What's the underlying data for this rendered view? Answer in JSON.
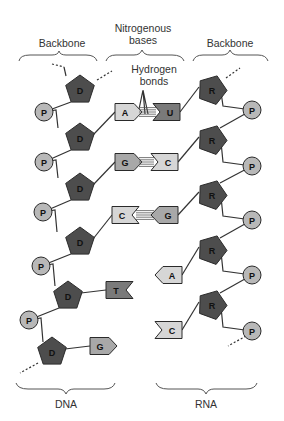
{
  "labels": {
    "backbone_left": "Backbone",
    "nitrogenous_line1": "Nitrogenous",
    "nitrogenous_line2": "bases",
    "backbone_right": "Backbone",
    "hydrogen_line1": "Hydrogen",
    "hydrogen_line2": "bonds",
    "dna": "DNA",
    "rna": "RNA"
  },
  "colors": {
    "sugar": "#4d4d4d",
    "phosphate": "#b8b8b8",
    "base_light": "#d6d6d6",
    "base_mid": "#a8a8a8",
    "base_dark": "#7a7a7a",
    "outline": "#2a2a2a"
  },
  "dna": {
    "sugar_letter": "D",
    "phosphate_letter": "P",
    "sugars": [
      {
        "x": 80,
        "y": 90
      },
      {
        "x": 80,
        "y": 138
      },
      {
        "x": 80,
        "y": 188
      },
      {
        "x": 80,
        "y": 242
      },
      {
        "x": 68,
        "y": 296
      },
      {
        "x": 52,
        "y": 352
      }
    ],
    "phosphates": [
      {
        "x": 44,
        "y": 112
      },
      {
        "x": 44,
        "y": 162
      },
      {
        "x": 43,
        "y": 212
      },
      {
        "x": 41,
        "y": 266
      },
      {
        "x": 29,
        "y": 320
      }
    ],
    "bases": [
      {
        "letter": "A",
        "x": 127,
        "y": 112
      },
      {
        "letter": "G",
        "x": 127,
        "y": 162
      },
      {
        "letter": "C",
        "x": 124,
        "y": 215
      },
      {
        "letter": "T",
        "x": 118,
        "y": 290
      },
      {
        "letter": "G",
        "x": 102,
        "y": 346
      }
    ]
  },
  "rna": {
    "sugar_letter": "R",
    "phosphate_letter": "P",
    "sugars": [
      {
        "x": 212,
        "y": 90
      },
      {
        "x": 212,
        "y": 140
      },
      {
        "x": 212,
        "y": 195
      },
      {
        "x": 212,
        "y": 250
      },
      {
        "x": 212,
        "y": 305
      }
    ],
    "phosphates": [
      {
        "x": 252,
        "y": 110
      },
      {
        "x": 252,
        "y": 166
      },
      {
        "x": 252,
        "y": 220
      },
      {
        "x": 252,
        "y": 275
      },
      {
        "x": 252,
        "y": 331
      }
    ],
    "bases": [
      {
        "letter": "U",
        "x": 168,
        "y": 112
      },
      {
        "letter": "C",
        "x": 166,
        "y": 162
      },
      {
        "letter": "G",
        "x": 166,
        "y": 215
      },
      {
        "letter": "A",
        "x": 170,
        "y": 275
      },
      {
        "letter": "C",
        "x": 170,
        "y": 330
      }
    ]
  }
}
